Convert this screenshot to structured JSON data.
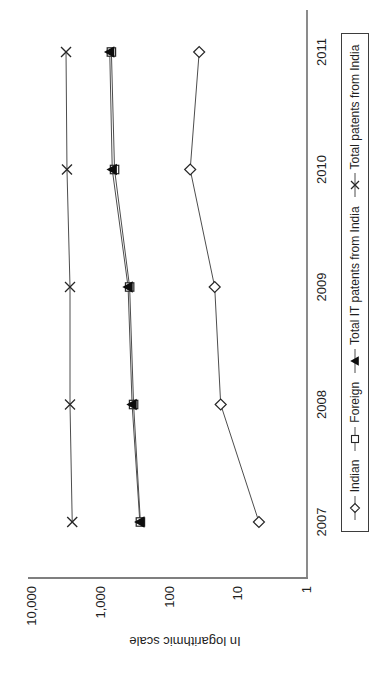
{
  "chart_data": {
    "type": "line",
    "title": "",
    "ylabel": "In logarithmic scale",
    "xlabel": "",
    "yscale": "log",
    "ylim": [
      1,
      10000
    ],
    "ytick_values": [
      1,
      10,
      100,
      1000,
      10000
    ],
    "ytick_labels": [
      "1",
      "10",
      "100",
      "1,000",
      "10,000"
    ],
    "categories": [
      "2007",
      "2008",
      "2009",
      "2010",
      "2011"
    ],
    "grid": "off",
    "legend_position": "bottom",
    "orientation": "landscape chart rotated 90 degrees counterclockwise on portrait page",
    "series": [
      {
        "name": "Indian",
        "marker": "diamond-open",
        "values": [
          5,
          18,
          22,
          50,
          37
        ]
      },
      {
        "name": "Foreign",
        "marker": "square-open",
        "values": [
          265,
          333,
          380,
          630,
          700
        ]
      },
      {
        "name": "Total IT patents from India",
        "marker": "triangle-filled",
        "values": [
          270,
          350,
          400,
          680,
          740
        ]
      },
      {
        "name": "Total patents from India",
        "marker": "x-cross",
        "values": [
          2600,
          2800,
          2800,
          3100,
          3200
        ]
      }
    ]
  },
  "colors": {
    "background": "#ffffff",
    "axis_line": "#7f7f7f",
    "series_line": "#4d4d4d",
    "marker_stroke": "#262626",
    "marker_fill_open": "#ffffff",
    "marker_fill_solid": "#0d0d0d",
    "text": "#1f1f1f",
    "legend_border": "#3d3d3d"
  }
}
